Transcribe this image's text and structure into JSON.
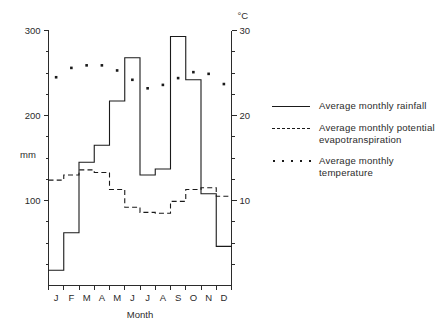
{
  "chart_data": {
    "type": "line",
    "title": "",
    "xlabel": "Month",
    "ylabel": "mm",
    "y2label": "°C",
    "categories": [
      "J",
      "F",
      "M",
      "A",
      "M",
      "J",
      "J",
      "A",
      "S",
      "O",
      "N",
      "D"
    ],
    "ylim": [
      0,
      300
    ],
    "y2lim": [
      0,
      30
    ],
    "yticks": [
      100,
      200,
      300
    ],
    "y2ticks": [
      10,
      20,
      30
    ],
    "grid": false,
    "legend_position": "right",
    "series": [
      {
        "name": "Average monthly rainfall",
        "style": "step-solid",
        "axis": "left",
        "unit": "mm",
        "values": [
          18,
          62,
          145,
          165,
          217,
          268,
          130,
          137,
          293,
          242,
          108,
          46
        ]
      },
      {
        "name": "Average monthly potential evapotranspiration",
        "style": "step-dashed",
        "axis": "left",
        "unit": "mm",
        "values": [
          124,
          130,
          136,
          133,
          113,
          92,
          86,
          85,
          99,
          113,
          115,
          105
        ]
      },
      {
        "name": "Average monthly temperature",
        "style": "dots",
        "axis": "right",
        "unit": "°C",
        "values": [
          24.5,
          25.6,
          25.9,
          25.9,
          25.3,
          24.2,
          23.2,
          23.6,
          24.4,
          25.1,
          24.9,
          23.7
        ]
      }
    ]
  },
  "axes": {
    "left_title": "mm",
    "right_title": "°C",
    "x_title": "Month",
    "left_tick_labels": [
      "100",
      "200",
      "300"
    ],
    "right_tick_labels": [
      "10",
      "20",
      "30"
    ],
    "month_labels": [
      "J",
      "F",
      "M",
      "A",
      "M",
      "J",
      "J",
      "A",
      "S",
      "O",
      "N",
      "D"
    ]
  },
  "legend": {
    "items": [
      {
        "label": "Average monthly rainfall",
        "marker": "solid-line"
      },
      {
        "label": "Average monthly potential evapotranspiration",
        "marker": "dashed-line"
      },
      {
        "label": "Average monthly temperature",
        "marker": "dotted-line"
      }
    ]
  },
  "colors": {
    "ink": "#1a1a1a",
    "axis": "#2b2b2b",
    "background": "#ffffff"
  }
}
